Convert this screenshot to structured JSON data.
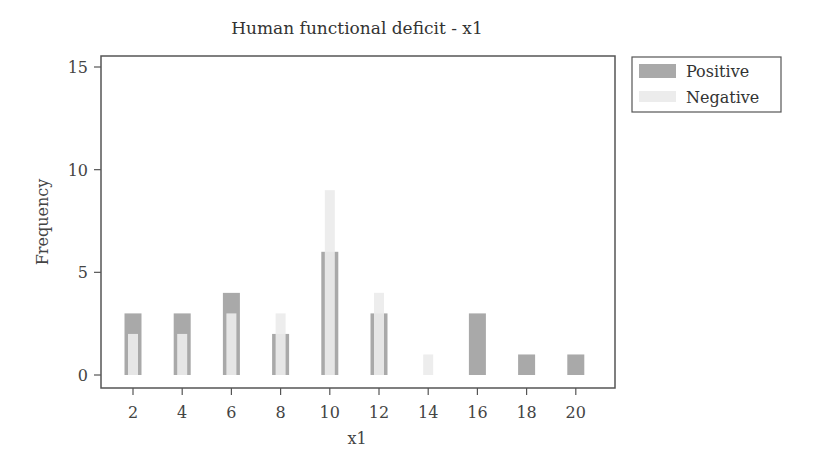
{
  "chart_data": {
    "type": "bar",
    "title": "Human functional deficit - x1",
    "xlabel": "x1",
    "ylabel": "Frequency",
    "categories": [
      2,
      4,
      6,
      8,
      10,
      12,
      14,
      16,
      18,
      20
    ],
    "series": [
      {
        "name": "Positive",
        "color": "#a9a9a9",
        "values": [
          3,
          3,
          4,
          2,
          6,
          3,
          0,
          3,
          1,
          1
        ]
      },
      {
        "name": "Negative",
        "color": "#ececec",
        "values": [
          2,
          2,
          3,
          3,
          9,
          4,
          1,
          0,
          0,
          0
        ]
      }
    ],
    "x_ticks": [
      2,
      4,
      6,
      8,
      10,
      12,
      14,
      16,
      18,
      20
    ],
    "y_ticks": [
      0,
      5,
      10,
      15
    ],
    "ylim": [
      0,
      16
    ],
    "grid": false,
    "legend_position": "right-top"
  },
  "legend": {
    "items": [
      {
        "label": "Positive",
        "color": "#a9a9a9"
      },
      {
        "label": "Negative",
        "color": "#ececec"
      }
    ]
  }
}
